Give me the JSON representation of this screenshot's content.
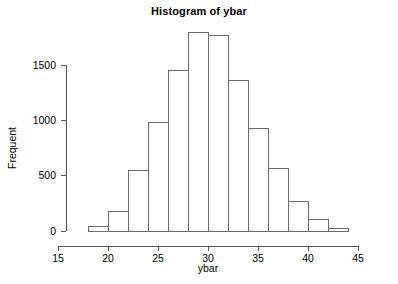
{
  "chart_data": {
    "type": "bar",
    "title": "Histogram of ybar",
    "xlabel": "ybar",
    "ylabel": "Frequent",
    "grid": false,
    "legend": null,
    "xlim": [
      15,
      47
    ],
    "ylim": [
      0,
      1800
    ],
    "xticks": [
      15,
      20,
      25,
      30,
      35,
      40,
      45
    ],
    "xtick_labels": [
      "15",
      "20",
      "25",
      "30",
      "35",
      "40",
      "45"
    ],
    "yticks": [
      0,
      500,
      1000,
      1500
    ],
    "ytick_labels": [
      "0",
      "500",
      "1000",
      "1500"
    ],
    "bin_width": 2,
    "bin_edges": [
      18,
      20,
      22,
      24,
      26,
      28,
      30,
      32,
      34,
      36,
      38,
      40,
      42,
      44
    ],
    "categories": [
      "18-20",
      "20-22",
      "22-24",
      "24-26",
      "26-28",
      "28-30",
      "30-32",
      "32-34",
      "34-36",
      "36-38",
      "38-40",
      "40-42",
      "42-44"
    ],
    "values": [
      40,
      175,
      545,
      980,
      1450,
      1790,
      1770,
      1360,
      930,
      565,
      265,
      105,
      20
    ],
    "bars": [
      {
        "x0": 18,
        "x1": 20,
        "value": 40
      },
      {
        "x0": 20,
        "x1": 22,
        "value": 175
      },
      {
        "x0": 22,
        "x1": 24,
        "value": 545
      },
      {
        "x0": 24,
        "x1": 26,
        "value": 980
      },
      {
        "x0": 26,
        "x1": 28,
        "value": 1450
      },
      {
        "x0": 28,
        "x1": 30,
        "value": 1790
      },
      {
        "x0": 30,
        "x1": 32,
        "value": 1770
      },
      {
        "x0": 32,
        "x1": 34,
        "value": 1360
      },
      {
        "x0": 34,
        "x1": 36,
        "value": 930
      },
      {
        "x0": 36,
        "x1": 38,
        "value": 565
      },
      {
        "x0": 38,
        "x1": 40,
        "value": 265
      },
      {
        "x0": 40,
        "x1": 42,
        "value": 105
      },
      {
        "x0": 42,
        "x1": 44,
        "value": 20
      }
    ],
    "colors": {
      "bar_stroke": "#6b6b6b",
      "bar_fill": "none",
      "axis": "#555555",
      "text": "#000000",
      "background": "#ffffff"
    }
  }
}
